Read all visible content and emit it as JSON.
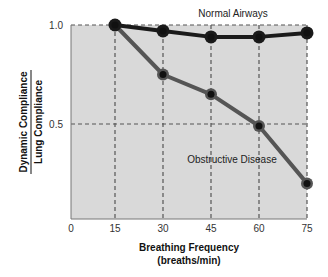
{
  "chart_data": {
    "type": "line",
    "title": "",
    "xlabel": "Breathing Frequency (breaths/min)",
    "xlabel_line1": "Breathing Frequency",
    "xlabel_line2": "(breaths/min)",
    "ylabel": "Dynamic Compliance / Lung Compliance",
    "ylabel_numerator": "Dynamic Compliance",
    "ylabel_denominator": "Lung Compliance",
    "x": [
      15,
      30,
      45,
      60,
      75
    ],
    "x_ticks": [
      "0",
      "15",
      "30",
      "45",
      "60",
      "75"
    ],
    "y_ticks": [
      "0.5",
      "1.0"
    ],
    "xlim": [
      0,
      75
    ],
    "ylim": [
      0,
      1.0
    ],
    "grid": true,
    "grid_style": "dashed",
    "series": [
      {
        "name": "Normal Airways",
        "values": [
          1.0,
          0.97,
          0.94,
          0.94,
          0.96
        ],
        "color": "#1a1a1a"
      },
      {
        "name": "Obstructive Disease",
        "values": [
          1.0,
          0.75,
          0.65,
          0.49,
          0.2
        ],
        "color": "#555555"
      }
    ],
    "annotations": [
      {
        "text": "Normal Airways",
        "near_series": "Normal Airways"
      },
      {
        "text": "Obstructive Disease",
        "near_series": "Obstructive Disease"
      }
    ],
    "colors": {
      "plot_background": "#d9d9d9",
      "grid": "#555555",
      "marker_fill": "#111111"
    }
  }
}
